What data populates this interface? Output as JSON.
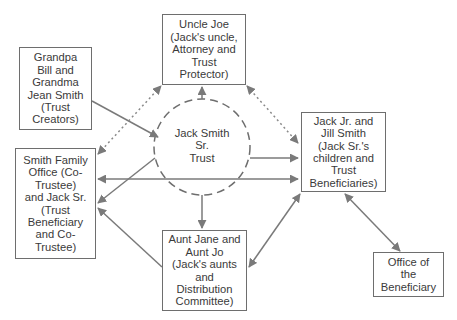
{
  "diagram": {
    "type": "trust-relationship-diagram",
    "center": {
      "id": "trust",
      "label": "Jack Smith Sr. Trust",
      "lines": [
        "Jack Smith",
        "Sr.",
        "Trust"
      ],
      "shape": "dashed-circle"
    },
    "nodes": [
      {
        "id": "uncle_joe",
        "lines": [
          "Uncle Joe",
          "(Jack's uncle,",
          "Attorney and",
          "Trust",
          "Protector)"
        ]
      },
      {
        "id": "grandparents",
        "lines": [
          "Grandpa",
          "Bill and",
          "Grandma",
          "Jean Smith",
          "(Trust",
          "Creators)"
        ]
      },
      {
        "id": "family_office",
        "lines": [
          "Smith Family",
          "Office (Co-",
          "Trustee)",
          "and Jack Sr.",
          "(Trust",
          "Beneficiary",
          "and Co-",
          "Trustee)"
        ]
      },
      {
        "id": "children",
        "lines": [
          "Jack Jr. and",
          "Jill Smith",
          "(Jack Sr.'s",
          "children and",
          "Trust",
          "Beneficiaries)"
        ]
      },
      {
        "id": "aunts",
        "lines": [
          "Aunt Jane and",
          "Aunt Jo",
          "(Jack's aunts",
          "and",
          "Distribution",
          "Committee)"
        ]
      },
      {
        "id": "beneficiary_office",
        "lines": [
          "Office of",
          "the",
          "Beneficiary"
        ]
      }
    ],
    "edges": [
      {
        "from": "grandparents",
        "to": "trust",
        "style": "solid",
        "direction": "forward"
      },
      {
        "from": "trust",
        "to": "uncle_joe",
        "style": "solid",
        "direction": "forward"
      },
      {
        "from": "family_office",
        "to": "uncle_joe",
        "style": "dotted",
        "direction": "both"
      },
      {
        "from": "uncle_joe",
        "to": "children",
        "style": "dotted",
        "direction": "both"
      },
      {
        "from": "trust",
        "to": "children",
        "style": "solid",
        "direction": "forward"
      },
      {
        "from": "family_office",
        "to": "children",
        "style": "solid",
        "direction": "both"
      },
      {
        "from": "trust",
        "to": "family_office",
        "style": "solid",
        "direction": "forward"
      },
      {
        "from": "aunts",
        "to": "family_office",
        "style": "solid",
        "direction": "forward"
      },
      {
        "from": "trust",
        "to": "aunts",
        "style": "solid",
        "direction": "forward"
      },
      {
        "from": "aunts",
        "to": "children",
        "style": "solid",
        "direction": "both"
      },
      {
        "from": "children",
        "to": "beneficiary_office",
        "style": "solid",
        "direction": "both"
      }
    ],
    "colors": {
      "line": "#7a7a7a",
      "border": "#6e6e6e",
      "text": "#3a3a3a"
    }
  }
}
